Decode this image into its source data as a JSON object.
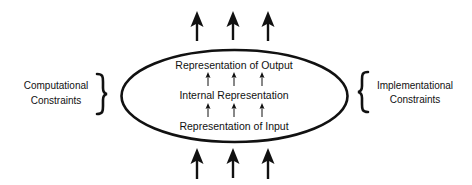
{
  "diagram": {
    "type": "conceptual-levels-diagram",
    "colors": {
      "stroke": "#111111",
      "background": "#ffffff"
    },
    "ellipse": {
      "inner_levels": [
        {
          "id": "output",
          "label": "Representation of Output"
        },
        {
          "id": "internal",
          "label": "Internal Representation"
        },
        {
          "id": "input",
          "label": "Representation of Input"
        }
      ]
    },
    "left_constraint": {
      "line1": "Computational",
      "line2": "Constraints",
      "brace": "}"
    },
    "right_constraint": {
      "line1": "Implementational",
      "line2": "Constraints",
      "brace": "{"
    },
    "external_arrows": {
      "top_count": 3,
      "bottom_count": 3,
      "direction": "up"
    },
    "internal_arrows": {
      "between_input_and_internal": 3,
      "between_internal_and_output": 3,
      "direction": "up"
    }
  }
}
